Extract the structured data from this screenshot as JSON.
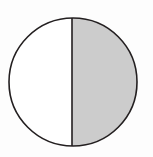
{
  "figure": {
    "name": "circle-halved-right-shaded",
    "canvas": {
      "width": 153,
      "height": 157,
      "background_color": "#fdfdfd"
    },
    "circle": {
      "center_x": 73,
      "center_y": 82,
      "radius": 64,
      "stroke_color": "#231f20",
      "stroke_width": 1.6,
      "fill_color": "#ffffff"
    },
    "divider": {
      "label": "vertical-diameter",
      "x": 72,
      "y_top": 18,
      "y_bottom": 146,
      "stroke_color": "#231f20",
      "stroke_width": 1.6
    },
    "halves": [
      {
        "label": "left-half",
        "side": "left",
        "shaded": false,
        "fill_color": "#ffffff",
        "fraction": "1/2"
      },
      {
        "label": "right-half",
        "side": "right",
        "shaded": true,
        "fill_color": "#cccccc",
        "fraction": "1/2"
      }
    ]
  },
  "chart_data": {
    "type": "pie",
    "title": "",
    "categories": [
      "left half",
      "right half"
    ],
    "values": [
      50,
      50
    ],
    "labels": [
      "1/2",
      "1/2"
    ],
    "colors": [
      "#ffffff",
      "#cccccc"
    ],
    "legend": "none",
    "grid": false,
    "annotations": []
  }
}
